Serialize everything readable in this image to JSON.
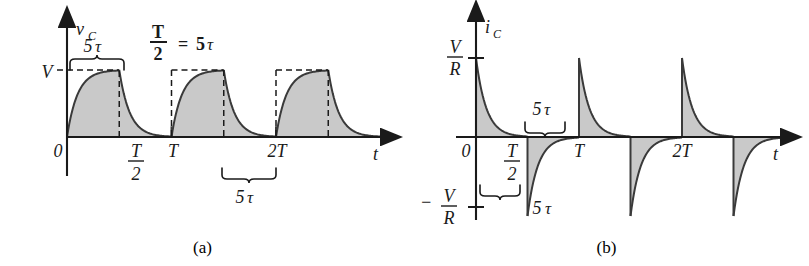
{
  "figure": {
    "background": "#ffffff",
    "fill_color": "#c9c9c9",
    "stroke_color": "#3a3a3a",
    "axis_color": "#1a1a1a"
  },
  "panel_a": {
    "caption": "(a)",
    "y_axis_label": "v",
    "y_axis_sub": "C",
    "x_axis_label": "t",
    "y_tick_label": "V",
    "annotation_equation": {
      "num": "T",
      "den": "2",
      "eq": "=",
      "rhs": "5",
      "tau": "τ"
    },
    "x_tick_labels": [
      {
        "label": "0",
        "x_value": 0
      },
      {
        "label_num": "T",
        "label_den": "2",
        "x_value": 0.5
      },
      {
        "label": "T",
        "x_value": 1
      },
      {
        "label": "2T",
        "x_value": 2
      }
    ],
    "brace_top_label": {
      "value": "5",
      "tau": "τ"
    },
    "brace_bottom_label": {
      "value": "5",
      "tau": "τ"
    }
  },
  "panel_b": {
    "caption": "(b)",
    "y_axis_label": "i",
    "y_axis_sub": "C",
    "x_axis_label": "t",
    "y_tick_pos_num": "V",
    "y_tick_pos_den": "R",
    "y_tick_neg_sign": "−",
    "y_tick_neg_num": "V",
    "y_tick_neg_den": "R",
    "x_tick_labels": [
      {
        "label": "0",
        "x_value": 0
      },
      {
        "label_num": "T",
        "label_den": "2",
        "x_value": 0.5
      },
      {
        "label": "T",
        "x_value": 1
      },
      {
        "label": "2T",
        "x_value": 2
      }
    ],
    "brace_upper_label": {
      "value": "5",
      "tau": "τ"
    },
    "brace_lower_label": {
      "value": "5",
      "tau": "τ"
    }
  },
  "chart_data": [
    {
      "id": "panel-a",
      "type": "line",
      "title": "Capacitor voltage v_C versus time",
      "subtitle": "(a)",
      "xlabel": "t",
      "ylabel": "v_C",
      "annotation": "T/2 = 5τ",
      "grid": false,
      "legend": "none",
      "xlim": [
        -0.18,
        2.95
      ],
      "ylim": [
        -0.12,
        1.35
      ],
      "x_ticks": [
        {
          "value": 0,
          "label": "0"
        },
        {
          "value": 0.5,
          "label": "T/2"
        },
        {
          "value": 1,
          "label": "T"
        },
        {
          "value": 2,
          "label": "2T"
        }
      ],
      "y_ticks": [
        {
          "value": 1,
          "label": "V"
        }
      ],
      "time_constant_tau": 0.1,
      "half_period": 0.5,
      "period": 1,
      "amplitude_V": 1,
      "series": [
        {
          "name": "v_C(t)",
          "shaded": true,
          "description": "Charging exponential V(1-e^{-t/tau}) on [0,T/2], discharging V e^{-(t-T/2)/tau} on [T/2,T], repeated each period T",
          "segments": [
            {
              "kind": "charge",
              "t_start": 0.0,
              "t_end": 0.5,
              "from": 0,
              "to": 1
            },
            {
              "kind": "discharge",
              "t_start": 0.5,
              "t_end": 1.0,
              "from": 1,
              "to": 0
            },
            {
              "kind": "charge",
              "t_start": 1.0,
              "t_end": 1.5,
              "from": 0,
              "to": 1
            },
            {
              "kind": "discharge",
              "t_start": 1.5,
              "t_end": 2.0,
              "from": 1,
              "to": 0
            },
            {
              "kind": "charge",
              "t_start": 2.0,
              "t_end": 2.5,
              "from": 0,
              "to": 1
            },
            {
              "kind": "discharge",
              "t_start": 2.5,
              "t_end": 3.0,
              "from": 1,
              "to": 0
            }
          ]
        }
      ],
      "dashed_guides": [
        {
          "type": "horizontal",
          "y": 1,
          "x_from": 0,
          "x_to": 0.5,
          "label": "V"
        },
        {
          "type": "vertical",
          "x": 0.5,
          "y_from": 0,
          "y_to": 1
        },
        {
          "type": "box",
          "x_from": 1.0,
          "x_to": 1.5,
          "y": 1
        },
        {
          "type": "box",
          "x_from": 2.0,
          "x_to": 2.5,
          "y": 1
        }
      ],
      "braces": [
        {
          "x_from": 0.0,
          "x_to": 0.5,
          "position": "above",
          "label": "5τ"
        },
        {
          "x_from": 1.5,
          "x_to": 2.0,
          "position": "below",
          "label": "5τ"
        }
      ]
    },
    {
      "id": "panel-b",
      "type": "line",
      "title": "Capacitor current i_C versus time",
      "subtitle": "(b)",
      "xlabel": "t",
      "ylabel": "i_C",
      "grid": false,
      "legend": "none",
      "xlim": [
        -0.18,
        2.95
      ],
      "ylim": [
        -1.35,
        1.35
      ],
      "x_ticks": [
        {
          "value": 0,
          "label": "0"
        },
        {
          "value": 0.5,
          "label": "T/2"
        },
        {
          "value": 1,
          "label": "T"
        },
        {
          "value": 2,
          "label": "2T"
        }
      ],
      "y_ticks": [
        {
          "value": 1,
          "label": "V/R"
        },
        {
          "value": -1,
          "label": "−V/R"
        }
      ],
      "time_constant_tau": 0.1,
      "half_period": 0.5,
      "period": 1,
      "amplitude_V_over_R": 1,
      "series": [
        {
          "name": "i_C(t)",
          "shaded": true,
          "description": "Positive decaying spike (V/R)e^{-t/tau} at each rising edge, negative decaying spike -(V/R)e^{-t/tau} at each falling edge",
          "segments": [
            {
              "kind": "decay-positive",
              "t_start": 0.0,
              "t_end": 0.5,
              "from": 1,
              "to": 0
            },
            {
              "kind": "decay-negative",
              "t_start": 0.5,
              "t_end": 1.0,
              "from": -1,
              "to": 0
            },
            {
              "kind": "decay-positive",
              "t_start": 1.0,
              "t_end": 1.5,
              "from": 1,
              "to": 0
            },
            {
              "kind": "decay-negative",
              "t_start": 1.5,
              "t_end": 2.0,
              "from": -1,
              "to": 0
            },
            {
              "kind": "decay-positive",
              "t_start": 2.0,
              "t_end": 2.5,
              "from": 1,
              "to": 0
            },
            {
              "kind": "decay-negative",
              "t_start": 2.5,
              "t_end": 3.0,
              "from": -1,
              "to": 0
            }
          ]
        }
      ],
      "braces": [
        {
          "x_from": 0.0,
          "x_to": 0.5,
          "position": "below",
          "label": "5τ"
        },
        {
          "x_from": 0.5,
          "x_to": 1.0,
          "position": "above",
          "label": "5τ"
        }
      ]
    }
  ]
}
